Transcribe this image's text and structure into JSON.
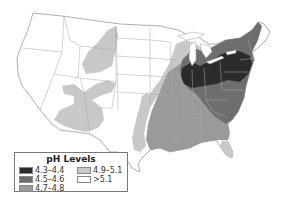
{
  "map": {
    "title": "pH Levels",
    "subject": "Precipitation pH across contiguous United States",
    "colors": {
      "outline": "#9a9a9a",
      "land": "#ffffff",
      "lake": "#ffffff"
    }
  },
  "legend": {
    "title": "pH Levels",
    "items": [
      {
        "label": "4.3–4.4",
        "color": "#2b2b2b"
      },
      {
        "label": "4.5–4.6",
        "color": "#6e6e6e"
      },
      {
        "label": "4.7–4.8",
        "color": "#9a9a9a"
      },
      {
        "label": "4.9–5.1",
        "color": "#c8c8c8"
      },
      {
        "label": ">5.1",
        "color": "#ffffff"
      }
    ]
  }
}
